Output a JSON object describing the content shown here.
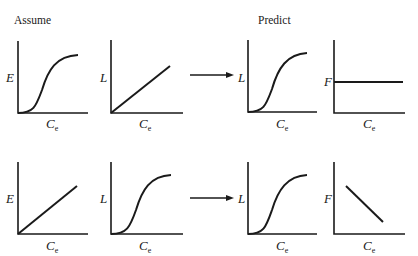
{
  "headings": {
    "assume": "Assume",
    "predict": "Predict"
  },
  "axis_labels": {
    "E": "E",
    "L": "L",
    "F": "F",
    "Ce_main": "C",
    "Ce_sub": "e"
  },
  "rows": [
    {
      "assume": [
        {
          "y_label": "E",
          "x_label": "Ce",
          "shape": "sigmoid"
        },
        {
          "y_label": "L",
          "x_label": "Ce",
          "shape": "linear-increasing"
        }
      ],
      "predict": [
        {
          "y_label": "L",
          "x_label": "Ce",
          "shape": "sigmoid"
        },
        {
          "y_label": "F",
          "x_label": "Ce",
          "shape": "constant"
        }
      ]
    },
    {
      "assume": [
        {
          "y_label": "E",
          "x_label": "Ce",
          "shape": "linear-increasing"
        },
        {
          "y_label": "L",
          "x_label": "Ce",
          "shape": "sigmoid"
        }
      ],
      "predict": [
        {
          "y_label": "L",
          "x_label": "Ce",
          "shape": "sigmoid"
        },
        {
          "y_label": "F",
          "x_label": "Ce",
          "shape": "linear-decreasing"
        }
      ]
    }
  ]
}
